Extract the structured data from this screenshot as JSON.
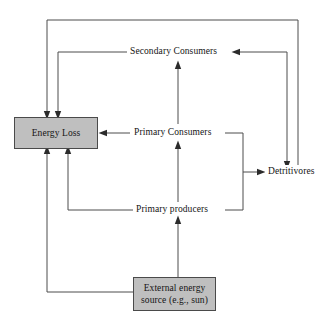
{
  "diagram": {
    "style": {
      "box_fill": "#bfbfbf",
      "box_stroke": "#4a4a4a",
      "edge_stroke": "#4d4d4d",
      "text_color": "#141414",
      "background": "#ffffff"
    },
    "nodes": [
      {
        "id": "energy-loss",
        "label": "Energy Loss",
        "shape": "filled-rect",
        "x": 14,
        "y": 117,
        "width": 84,
        "height": 32
      },
      {
        "id": "secondary-consumers",
        "label": "Secondary Consumers",
        "shape": "text",
        "x": 127,
        "y": 45
      },
      {
        "id": "primary-consumers",
        "label": "Primary Consumers",
        "shape": "text",
        "x": 131,
        "y": 126
      },
      {
        "id": "primary-producers",
        "label": "Primary producers",
        "shape": "text",
        "x": 133,
        "y": 203
      },
      {
        "id": "detritivores",
        "label": "Detritivores",
        "shape": "text",
        "x": 265,
        "y": 165
      },
      {
        "id": "external-energy-source",
        "label_line1": "External energy",
        "label_line2": "source (e.g., sun)",
        "shape": "filled-rect",
        "x": 133,
        "y": 277,
        "width": 83,
        "height": 34
      }
    ],
    "edges": [
      {
        "id": "primary-producers-to-primary-consumers",
        "from": "primary-producers",
        "to": "primary-consumers"
      },
      {
        "id": "primary-consumers-to-secondary-consumers",
        "from": "primary-consumers",
        "to": "secondary-consumers"
      },
      {
        "id": "external-source-to-primary-producers",
        "from": "external-energy-source",
        "to": "primary-producers"
      },
      {
        "id": "primary-consumers-to-energy-loss",
        "from": "primary-consumers",
        "to": "energy-loss"
      },
      {
        "id": "primary-producers-to-energy-loss",
        "from": "primary-producers",
        "to": "energy-loss"
      },
      {
        "id": "secondary-consumers-to-energy-loss",
        "from": "secondary-consumers",
        "to": "energy-loss"
      },
      {
        "id": "detritivores-to-energy-loss",
        "from": "detritivores",
        "to": "energy-loss"
      },
      {
        "id": "external-source-to-energy-loss",
        "from": "external-energy-source",
        "to": "energy-loss"
      },
      {
        "id": "primary-producers-to-detritivores",
        "from": "primary-producers",
        "to": "detritivores"
      },
      {
        "id": "primary-consumers-to-detritivores",
        "from": "primary-consumers",
        "to": "detritivores"
      },
      {
        "id": "secondary-consumers-to-detritivores",
        "from": "secondary-consumers",
        "to": "detritivores"
      }
    ]
  }
}
